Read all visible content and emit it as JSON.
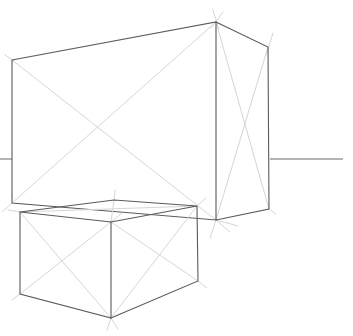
{
  "drawing": {
    "title": "Two-point perspective boxes sketch",
    "colors": {
      "edge": "#5a5a5a",
      "guide": "#d6d6d6",
      "horizon": "#6a6a6a",
      "background": "#ffffff"
    },
    "horizon": {
      "y": 159,
      "segments": [
        [
          0,
          12
        ],
        [
          270,
          343
        ]
      ]
    },
    "large_box": {
      "front_face": [
        [
          12,
          60
        ],
        [
          216,
          22
        ],
        [
          216,
          220
        ],
        [
          12,
          203
        ]
      ],
      "side_face": [
        [
          216,
          22
        ],
        [
          268,
          47
        ],
        [
          269,
          209
        ],
        [
          216,
          220
        ]
      ]
    },
    "small_box": {
      "top_face": [
        [
          20,
          212
        ],
        [
          114,
          200
        ],
        [
          197,
          206
        ],
        [
          111,
          222
        ]
      ],
      "left_face": [
        [
          20,
          212
        ],
        [
          111,
          222
        ],
        [
          111,
          318
        ],
        [
          20,
          294
        ]
      ],
      "right_face": [
        [
          111,
          222
        ],
        [
          197,
          206
        ],
        [
          198,
          281
        ],
        [
          111,
          318
        ]
      ]
    }
  }
}
